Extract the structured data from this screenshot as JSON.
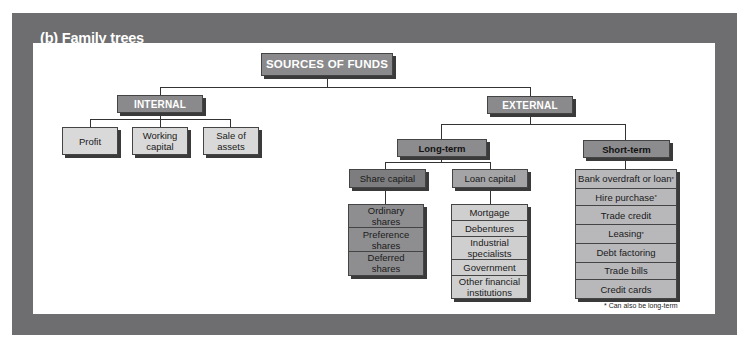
{
  "figure": {
    "title": "(b) Family trees"
  },
  "tree": {
    "root": "SOURCES OF FUNDS",
    "internal": {
      "label": "INTERNAL",
      "children": [
        "Profit",
        "Working capital",
        "Sale of assets"
      ]
    },
    "external": {
      "label": "EXTERNAL",
      "long_term": {
        "label": "Long-term",
        "share_capital": {
          "label": "Share capital",
          "items": [
            "Ordinary shares",
            "Preference shares",
            "Deferred shares"
          ]
        },
        "loan_capital": {
          "label": "Loan capital",
          "items": [
            "Mortgage",
            "Debentures",
            "Industrial specialists",
            "Government",
            "Other financial institutions"
          ]
        }
      },
      "short_term": {
        "label": "Short-term",
        "items": [
          {
            "label": "Bank overdraft or loan",
            "mark": "*"
          },
          {
            "label": "Hire purchase",
            "mark": "*"
          },
          {
            "label": "Trade credit",
            "mark": ""
          },
          {
            "label": "Leasing",
            "mark": "*"
          },
          {
            "label": "Debt factoring",
            "mark": ""
          },
          {
            "label": "Trade bills",
            "mark": ""
          },
          {
            "label": "Credit cards",
            "mark": ""
          }
        ]
      }
    }
  },
  "footnote": "* Can also be long-term",
  "colors": {
    "frame": "#6e6e70",
    "header_box": "#8a8a8c",
    "leaf_box": "#d9d9d9"
  }
}
